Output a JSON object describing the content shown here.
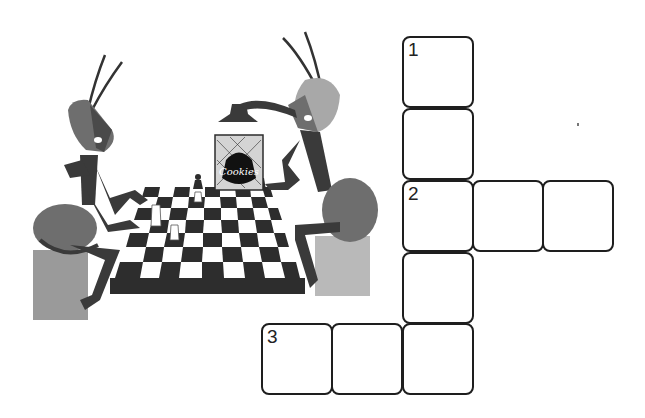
{
  "illustration": {
    "description": "Two cartoon ants playing chess with a cookie jar on the board",
    "jar_label": "Cookies",
    "colors": {
      "ant_dark": "#3a3a3a",
      "ant_mid": "#6e6e6e",
      "ant_light": "#a8a8a8",
      "board_dark": "#2d2d2d",
      "board_light": "#ffffff",
      "stool": "#9a9a9a"
    }
  },
  "crossword": {
    "border_color": "#1e1e1e",
    "cell_size": 72,
    "clues": [
      {
        "number": "1",
        "direction": "down",
        "length": 5
      },
      {
        "number": "2",
        "direction": "across",
        "length": 3
      },
      {
        "number": "3",
        "direction": "across",
        "length": 3
      }
    ],
    "cells": [
      {
        "id": "r0c2",
        "label": "1",
        "value": ""
      },
      {
        "id": "r1c2",
        "label": "",
        "value": ""
      },
      {
        "id": "r2c2",
        "label": "2",
        "value": ""
      },
      {
        "id": "r2c3",
        "label": "",
        "value": ""
      },
      {
        "id": "r2c4",
        "label": "",
        "value": ""
      },
      {
        "id": "r3c2",
        "label": "",
        "value": ""
      },
      {
        "id": "r4c0",
        "label": "3",
        "value": ""
      },
      {
        "id": "r4c1",
        "label": "",
        "value": ""
      },
      {
        "id": "r4c2",
        "label": "",
        "value": ""
      }
    ]
  }
}
